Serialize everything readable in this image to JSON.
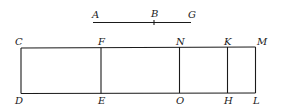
{
  "diagram": {
    "segment": {
      "labels": {
        "start": "A",
        "mid": "B",
        "end": "G"
      }
    },
    "rectangle": {
      "top_labels": [
        "C",
        "F",
        "N",
        "K",
        "M"
      ],
      "bottom_labels": [
        "D",
        "E",
        "O",
        "H",
        "L"
      ]
    },
    "colors": {
      "stroke": "#1a1a1a",
      "background": "#ffffff"
    }
  }
}
